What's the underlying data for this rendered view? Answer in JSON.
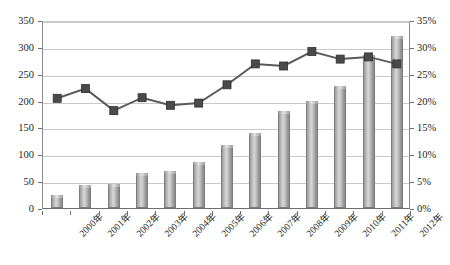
{
  "chart_data": {
    "type": "bar",
    "title": "",
    "subtitle": "",
    "xlabel": "",
    "ylabel": "",
    "y2label": "",
    "grid": true,
    "legend_position": "none",
    "categories": [
      "2000年",
      "2001年",
      "2002年",
      "2003年",
      "2004年",
      "2005年",
      "2006年",
      "2007年",
      "2008年",
      "2009年",
      "2010年",
      "2011年",
      "2012年"
    ],
    "ylim": [
      0,
      350
    ],
    "yticks": [
      0,
      50,
      100,
      150,
      200,
      250,
      300,
      350
    ],
    "ytick_labels": [
      "0",
      "50",
      "100",
      "150",
      "200",
      "250",
      "300",
      "350"
    ],
    "y2lim": [
      0,
      0.35
    ],
    "y2ticks": [
      0,
      5,
      10,
      15,
      20,
      25,
      30,
      35
    ],
    "y2tick_labels": [
      "0%",
      "5%",
      "10%",
      "15%",
      "20%",
      "25%",
      "30%",
      "35%"
    ],
    "series": [
      {
        "name": "bar-series",
        "type": "bar",
        "axis": "left",
        "color": "#b6b6b6",
        "edge_color": "#7c7c7c",
        "values": [
          25,
          42,
          45,
          65,
          68,
          85,
          117,
          140,
          180,
          200,
          227,
          285,
          320
        ]
      },
      {
        "name": "line-series",
        "type": "line",
        "axis": "right",
        "color": "#595959",
        "marker": "square",
        "marker_color": "#4a4a4a",
        "values": [
          20.8,
          22.6,
          18.5,
          20.9,
          19.5,
          19.9,
          23.3,
          27.2,
          26.8,
          29.5,
          28.1,
          28.5,
          27.2
        ],
        "value_labels": [
          "20.8%",
          "22.6%",
          "18.5%",
          "20.9%",
          "19.5%",
          "19.9%",
          "23.3%",
          "27.2%",
          "26.8%",
          "29.5%",
          "28.1%",
          "28.5%",
          "27.2%"
        ]
      }
    ]
  },
  "axes": {
    "left_axis_name": "left-value-axis",
    "right_axis_name": "right-percent-axis",
    "category_axis_name": "year-axis"
  }
}
